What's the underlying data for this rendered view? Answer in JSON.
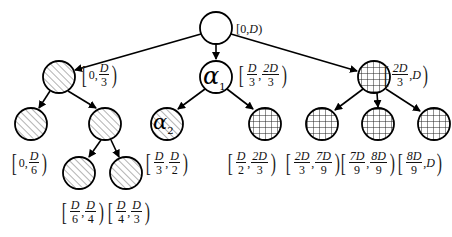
{
  "diagram": {
    "type": "tree",
    "nodes": [
      {
        "id": "root",
        "label": "",
        "interval": "[0,D)",
        "fill": "empty",
        "x": 216,
        "y": 28
      },
      {
        "id": "n1",
        "label": "",
        "interval": "[0,D/3)",
        "fill": "hatched",
        "x": 59,
        "y": 77
      },
      {
        "id": "alpha1",
        "label": "α1",
        "interval": "[D/3,2D/3)",
        "fill": "empty",
        "x": 216,
        "y": 77
      },
      {
        "id": "n3",
        "label": "",
        "interval": "[2D/3,D)",
        "fill": "grid",
        "x": 374,
        "y": 77
      },
      {
        "id": "n11",
        "label": "",
        "interval": "[0,D/6)",
        "fill": "hatched",
        "x": 31,
        "y": 124
      },
      {
        "id": "n12",
        "label": "",
        "interval": "",
        "fill": "hatched",
        "x": 105,
        "y": 124
      },
      {
        "id": "alpha2",
        "label": "α2",
        "interval": "[D/3,D/2)",
        "fill": "hatched",
        "x": 167,
        "y": 124
      },
      {
        "id": "n22",
        "label": "",
        "interval": "[D/2,2D/3)",
        "fill": "grid",
        "x": 265,
        "y": 124
      },
      {
        "id": "n31",
        "label": "",
        "interval": "[2D/3,7D/9)",
        "fill": "grid",
        "x": 322,
        "y": 124
      },
      {
        "id": "n32",
        "label": "",
        "interval": "[7D/9,8D/9)",
        "fill": "grid",
        "x": 378,
        "y": 124
      },
      {
        "id": "n33",
        "label": "",
        "interval": "[8D/9,D)",
        "fill": "grid",
        "x": 434,
        "y": 124
      },
      {
        "id": "n121",
        "label": "",
        "interval": "[D/6,D/4)",
        "fill": "hatched",
        "x": 79,
        "y": 173
      },
      {
        "id": "n122",
        "label": "",
        "interval": "[D/4,D/3)",
        "fill": "hatched",
        "x": 126,
        "y": 173
      }
    ],
    "edges": [
      [
        "root",
        "n1"
      ],
      [
        "root",
        "alpha1"
      ],
      [
        "root",
        "n3"
      ],
      [
        "n1",
        "n11"
      ],
      [
        "n1",
        "n12"
      ],
      [
        "alpha1",
        "alpha2"
      ],
      [
        "alpha1",
        "n22"
      ],
      [
        "n3",
        "n31"
      ],
      [
        "n3",
        "n32"
      ],
      [
        "n3",
        "n33"
      ],
      [
        "n12",
        "n121"
      ],
      [
        "n12",
        "n122"
      ]
    ]
  },
  "labels": {
    "root": {
      "zero": "0",
      "d": "D"
    },
    "n1": {
      "zero": "0",
      "num": "D",
      "den": "3"
    },
    "alpha1": {
      "text": "α",
      "sub": "1",
      "a_num": "D",
      "a_den": "3",
      "b_num": "2D",
      "b_den": "3"
    },
    "n3": {
      "a_num": "2D",
      "a_den": "3",
      "d": "D"
    },
    "n11": {
      "zero": "0",
      "num": "D",
      "den": "6"
    },
    "alpha2": {
      "text": "α",
      "sub": "2",
      "a_num": "D",
      "a_den": "3",
      "b_num": "D",
      "b_den": "2"
    },
    "n22": {
      "a_num": "D",
      "a_den": "2",
      "b_num": "2D",
      "b_den": "3"
    },
    "n31": {
      "a_num": "2D",
      "a_den": "3",
      "b_num": "7D",
      "b_den": "9"
    },
    "n32": {
      "a_num": "7D",
      "a_den": "9",
      "b_num": "8D",
      "b_den": "9"
    },
    "n33": {
      "a_num": "8D",
      "a_den": "9",
      "d": "D"
    },
    "n121": {
      "a_num": "D",
      "a_den": "6",
      "b_num": "D",
      "b_den": "4"
    },
    "n122": {
      "a_num": "D",
      "a_den": "4",
      "b_num": "D",
      "b_den": "3"
    },
    "lbracket": "[",
    "rparen": ")",
    "comma": ","
  },
  "colors": {
    "stroke": "#000000",
    "hatch": "#555555",
    "background": "#ffffff"
  }
}
